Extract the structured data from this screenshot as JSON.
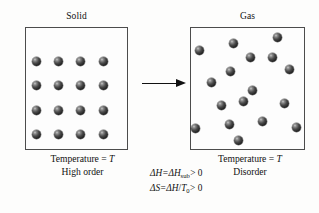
{
  "figure": {
    "type": "phase-transition-diagram"
  },
  "panels": {
    "left": {
      "title": "Solid",
      "caption_line1": "Temperature = T",
      "caption_line2": "High order",
      "lattice": {
        "rows": 4,
        "cols": 4,
        "count": 16
      }
    },
    "right": {
      "title": "Gas",
      "caption_line1": "Temperature = T",
      "caption_line2": "Disorder",
      "particles": {
        "count": 17
      }
    }
  },
  "arrow": {
    "name": "rightward-arrow",
    "direction": "right"
  },
  "equations": {
    "enthalpy": {
      "lhs": "ΔH",
      "equals": "=",
      "rhs_symbol": "ΔH",
      "rhs_subscript": "sub",
      "comparison": "> 0",
      "full": "ΔH = ΔHsub > 0"
    },
    "entropy": {
      "lhs": "ΔS",
      "equals": "=",
      "rhs_numerator": "ΔH",
      "slash": "/",
      "rhs_denominator_symbol": "T",
      "rhs_denominator_subscript": "0",
      "comparison": "> 0",
      "full": "ΔS = ΔH/T0 > 0"
    }
  },
  "colors": {
    "background": "#fdfdfc",
    "box_border": "#4c4c4c",
    "box_fill": "#fdfdfd",
    "sphere_dark": "#141414",
    "sphere_highlight": "#c9c9c9",
    "text": "#111111",
    "arrow": "#111111"
  },
  "geometry": {
    "solid_box": {
      "x": 25,
      "y": 27,
      "w": 103,
      "h": 123
    },
    "gas_box": {
      "x": 190,
      "y": 27,
      "w": 115,
      "h": 123
    },
    "sphere_diameter": 9,
    "solid_spheres": [
      {
        "x": 36,
        "y": 61
      },
      {
        "x": 58,
        "y": 61
      },
      {
        "x": 80,
        "y": 61
      },
      {
        "x": 103,
        "y": 61
      },
      {
        "x": 36,
        "y": 85
      },
      {
        "x": 58,
        "y": 85
      },
      {
        "x": 80,
        "y": 85
      },
      {
        "x": 103,
        "y": 85
      },
      {
        "x": 36,
        "y": 110
      },
      {
        "x": 58,
        "y": 110
      },
      {
        "x": 80,
        "y": 110
      },
      {
        "x": 103,
        "y": 110
      },
      {
        "x": 36,
        "y": 134
      },
      {
        "x": 58,
        "y": 134
      },
      {
        "x": 80,
        "y": 134
      },
      {
        "x": 103,
        "y": 134
      }
    ],
    "gas_spheres": [
      {
        "x": 199,
        "y": 50
      },
      {
        "x": 233,
        "y": 43
      },
      {
        "x": 277,
        "y": 37
      },
      {
        "x": 250,
        "y": 57
      },
      {
        "x": 230,
        "y": 71
      },
      {
        "x": 289,
        "y": 69
      },
      {
        "x": 211,
        "y": 82
      },
      {
        "x": 252,
        "y": 90
      },
      {
        "x": 221,
        "y": 105
      },
      {
        "x": 243,
        "y": 101
      },
      {
        "x": 284,
        "y": 103
      },
      {
        "x": 195,
        "y": 128
      },
      {
        "x": 229,
        "y": 124
      },
      {
        "x": 262,
        "y": 121
      },
      {
        "x": 296,
        "y": 127
      },
      {
        "x": 238,
        "y": 140
      },
      {
        "x": 272,
        "y": 57
      }
    ]
  }
}
